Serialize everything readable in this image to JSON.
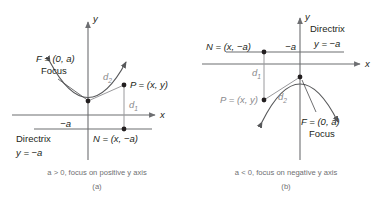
{
  "figure": {
    "colors": {
      "axis": "#6d6e71",
      "curve": "#58595b",
      "distance_line": "#9a9a9d",
      "directrix": "#6d6e71",
      "text": "#231f20",
      "caption_text": "#6f6f72",
      "gray_label": "#8a8a8d",
      "background": "#ffffff",
      "point_dot": "#231f20"
    },
    "panels": [
      {
        "id": "a",
        "name": "panel-a",
        "caption": "a > 0, focus on positive y axis",
        "panel_letter": "(a)",
        "axis_labels": {
          "x": "x",
          "y": "y"
        },
        "tick_label": "−a",
        "opens": "up",
        "labels": {
          "focus_point": "F = (0, a)",
          "focus_word": "Focus",
          "point_p": "P = (x, y)",
          "point_n": "N = (x, −a)",
          "directrix_word": "Directrix",
          "directrix_equation": "y = −a",
          "distance_focus": "d",
          "distance_focus_sub": "2",
          "distance_directrix": "d",
          "distance_directrix_sub": "1"
        }
      },
      {
        "id": "b",
        "name": "panel-b",
        "caption": "a < 0, focus on negative y axis",
        "panel_letter": "(b)",
        "axis_labels": {
          "x": "x",
          "y": "y"
        },
        "tick_label": "−a",
        "opens": "down",
        "labels": {
          "focus_point": "F = (0, a)",
          "focus_word": "Focus",
          "point_p": "P = (x, y)",
          "point_n": "N = (x, −a)",
          "directrix_word": "Directrix",
          "directrix_equation": "y = −a",
          "distance_focus": "d",
          "distance_focus_sub": "2",
          "distance_directrix": "d",
          "distance_directrix_sub": "1"
        }
      }
    ]
  }
}
